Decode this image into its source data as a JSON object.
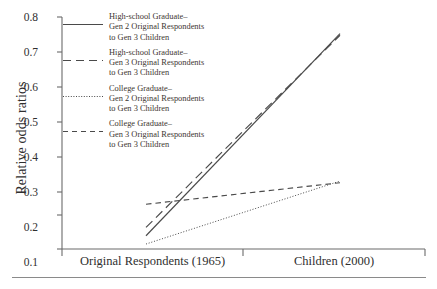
{
  "chart_data": {
    "type": "line",
    "title": "",
    "xlabel": "",
    "ylabel": "Relative odds ratios",
    "categories": [
      "Original Respondents (1965)",
      "Children (2000)"
    ],
    "ylim": [
      0.1,
      0.8
    ],
    "yticks": [
      "0.1",
      "0.2",
      "0.3",
      "0.4",
      "0.5",
      "0.6",
      "0.7",
      "0.8"
    ],
    "ytick_values": [
      0.1,
      0.2,
      0.3,
      0.4,
      0.5,
      0.6,
      0.7,
      0.8
    ],
    "grid": false,
    "legend_position": "upper-left-inside",
    "series": [
      {
        "name": "High-school Graduate–\nGen 2 Original Respondents\nto Gen 3 Children",
        "style": "solid",
        "values": [
          0.14,
          0.75
        ]
      },
      {
        "name": "High-school Graduate–\nGen 3 Original Respondents\nto Gen 3 Children",
        "style": "long-dash",
        "values": [
          0.165,
          0.745
        ]
      },
      {
        "name": "College Graduate–\nGen 2 Original Respondents\nto Gen 3 Children",
        "style": "dotted",
        "values": [
          0.115,
          0.305
        ]
      },
      {
        "name": "College Graduate–\nGen 3 Original Respondents\nto Gen 3 Children",
        "style": "dashed",
        "values": [
          0.235,
          0.3
        ]
      }
    ]
  },
  "axis": {
    "y_title": "Relative odds ratios",
    "y_tick_labels": [
      "0.8",
      "0.7",
      "0.6",
      "0.5",
      "0.4",
      "0.3",
      "0.2",
      "0.1"
    ],
    "x_tick_labels": [
      "Original Respondents (1965)",
      "Children (2000)"
    ]
  },
  "legend": {
    "entries": [
      {
        "label": "High-school Graduate–\nGen 2 Original Respondents\nto Gen 3 Children",
        "style": "solid"
      },
      {
        "label": "High-school Graduate–\nGen 3 Original Respondents\nto Gen 3 Children",
        "style": "long-dash"
      },
      {
        "label": "College Graduate–\nGen 2 Original Respondents\nto Gen 3 Children",
        "style": "dotted"
      },
      {
        "label": "College Graduate–\nGen 3 Original Respondents\nto Gen 3 Children",
        "style": "dashed"
      }
    ]
  },
  "colors": {
    "line": "#4a4a4a",
    "axis": "#6b6b6b",
    "text": "#2f2f2f",
    "legend_text": "#3c3530",
    "rule": "#8a8a8a"
  }
}
